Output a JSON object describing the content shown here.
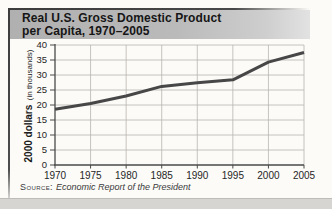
{
  "title": {
    "line1": "Real U.S. Gross Domestic Product",
    "line2": "per Capita, 1970–2005"
  },
  "y_axis": {
    "label_main": "2000 dollars",
    "label_note": "(in thousands)"
  },
  "source": {
    "prefix": "Source:",
    "text": "Economic Report of the President"
  },
  "chart_data": {
    "type": "line",
    "title": "Real U.S. Gross Domestic Product per Capita, 1970–2005",
    "x": [
      1970,
      1975,
      1980,
      1985,
      1990,
      1995,
      2000,
      2005
    ],
    "series": [
      {
        "name": "Real GDP per capita",
        "values": [
          18.6,
          20.5,
          23.0,
          26.2,
          27.4,
          28.4,
          34.3,
          37.5
        ]
      }
    ],
    "xlabel": "",
    "ylabel": "2000 dollars (in thousands)",
    "ylim": [
      0,
      40
    ],
    "yticks": [
      0,
      5,
      10,
      15,
      20,
      25,
      30,
      35,
      40
    ],
    "xticks": [
      "1970",
      "1975",
      "1980",
      "1985",
      "1990",
      "1995",
      "2000",
      "2005"
    ],
    "grid": true,
    "legend": false,
    "source": "Source: Economic Report of the President",
    "colors": {
      "line": "#474747",
      "grid": "#b7b5ae",
      "axis": "#4a4a4a",
      "tick_text": "#262626",
      "title_band": "#b9b9b9",
      "bottom_strip": "#d6d5d2"
    }
  }
}
